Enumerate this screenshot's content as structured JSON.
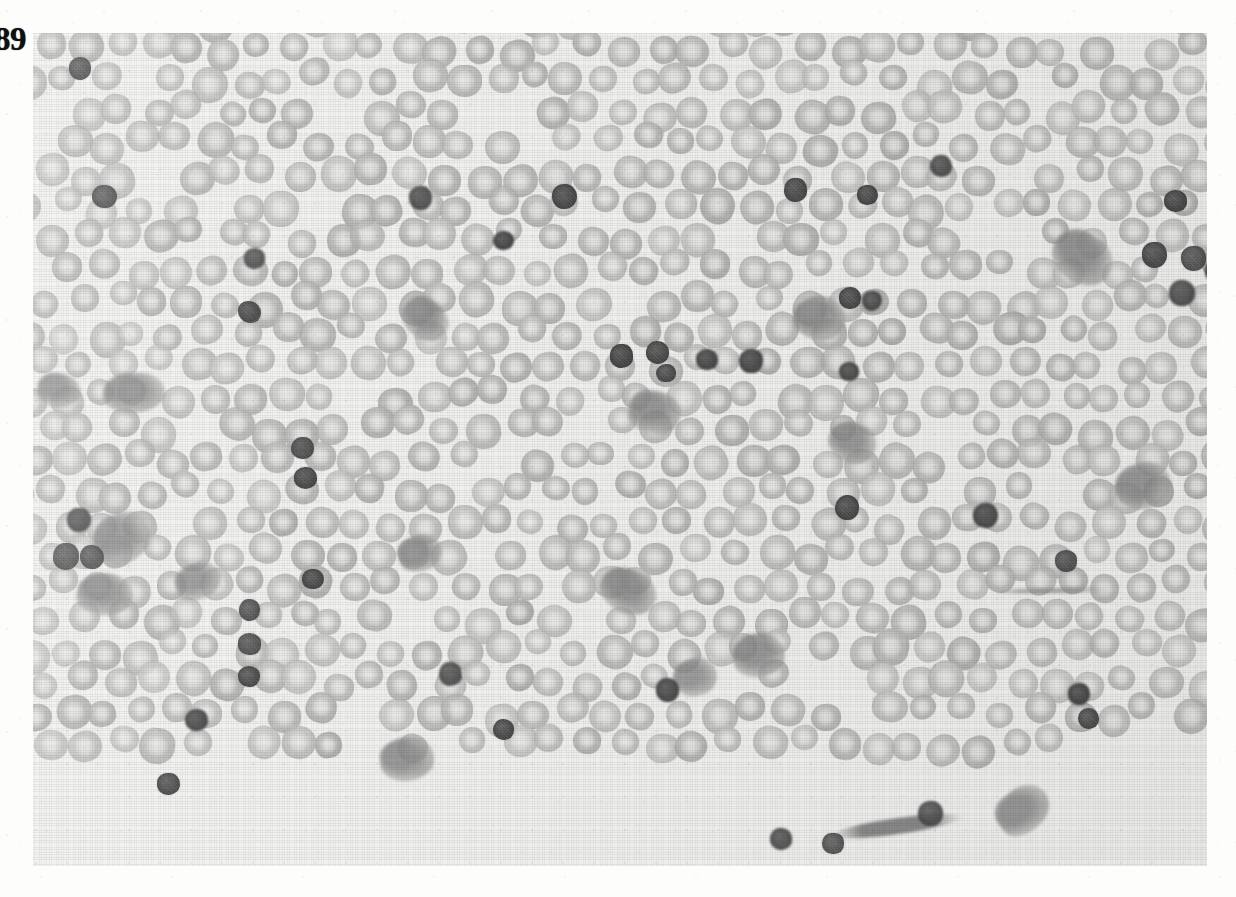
{
  "page": {
    "background_color": "#fdfdfc",
    "width": 1236,
    "height": 897
  },
  "figure": {
    "number_label": "89",
    "caption": "",
    "alt_text": "Peripheral blood smear photomicrograph showing a dense field of erythrocytes with numerous small dark-staining lymphocyte nuclei and scattered platelet clumps",
    "frame": {
      "left": 33,
      "top": 33,
      "width": 1174,
      "height": 833,
      "background_color": "#f1f1ef"
    }
  },
  "micrograph": {
    "title": "blood-smear-photomicrograph",
    "palette": {
      "background": "#f1f1ef",
      "erythrocyte": "#c6c6c4",
      "erythrocyte_dark": "#b2b2b0",
      "erythrocyte_pale_center": "#e6e6e4",
      "lymphocyte_nucleus": "#5a5a5a",
      "lymphocyte_nucleus_dark": "#454545",
      "platelet_clump": "#9a9a9a",
      "figure_number": "#101010"
    },
    "counts": {
      "erythrocytes": 760,
      "lymphocyte_nuclei": 46,
      "platelet_clumps": 17
    },
    "cell_sizes": {
      "erythrocyte_diameter_px": [
        26,
        36
      ],
      "lymphocyte_diameter_px": [
        18,
        30
      ],
      "clump_diameter_px": [
        28,
        62
      ]
    },
    "lymphocytes": [
      {
        "x": 36,
        "y": 24,
        "d": 22,
        "tone": 0.92
      },
      {
        "x": 59,
        "y": 152,
        "d": 25,
        "tone": 0.78
      },
      {
        "x": 211,
        "y": 215,
        "d": 21,
        "tone": 0.8
      },
      {
        "x": 207,
        "y": 269,
        "d": 21,
        "tone": 0.88
      },
      {
        "x": 376,
        "y": 153,
        "d": 23,
        "tone": 0.82
      },
      {
        "x": 460,
        "y": 198,
        "d": 21,
        "tone": 0.86
      },
      {
        "x": 519,
        "y": 151,
        "d": 25,
        "tone": 0.88
      },
      {
        "x": 751,
        "y": 145,
        "d": 23,
        "tone": 0.85
      },
      {
        "x": 824,
        "y": 152,
        "d": 21,
        "tone": 0.84
      },
      {
        "x": 897,
        "y": 122,
        "d": 22,
        "tone": 0.83
      },
      {
        "x": 1131,
        "y": 157,
        "d": 23,
        "tone": 0.88
      },
      {
        "x": 1109,
        "y": 209,
        "d": 25,
        "tone": 0.92
      },
      {
        "x": 1148,
        "y": 213,
        "d": 25,
        "tone": 0.9
      },
      {
        "x": 1172,
        "y": 227,
        "d": 22,
        "tone": 0.86
      },
      {
        "x": 1136,
        "y": 247,
        "d": 26,
        "tone": 0.94
      },
      {
        "x": 806,
        "y": 254,
        "d": 22,
        "tone": 0.86
      },
      {
        "x": 829,
        "y": 258,
        "d": 20,
        "tone": 0.82
      },
      {
        "x": 205,
        "y": 268,
        "d": 22,
        "tone": 0.88
      },
      {
        "x": 577,
        "y": 311,
        "d": 23,
        "tone": 0.88
      },
      {
        "x": 613,
        "y": 308,
        "d": 23,
        "tone": 0.9
      },
      {
        "x": 663,
        "y": 316,
        "d": 22,
        "tone": 0.86
      },
      {
        "x": 706,
        "y": 316,
        "d": 24,
        "tone": 0.88
      },
      {
        "x": 258,
        "y": 404,
        "d": 23,
        "tone": 0.88
      },
      {
        "x": 261,
        "y": 434,
        "d": 23,
        "tone": 0.9
      },
      {
        "x": 802,
        "y": 462,
        "d": 24,
        "tone": 0.86
      },
      {
        "x": 34,
        "y": 475,
        "d": 24,
        "tone": 0.9
      },
      {
        "x": 20,
        "y": 510,
        "d": 26,
        "tone": 0.92
      },
      {
        "x": 47,
        "y": 512,
        "d": 24,
        "tone": 0.9
      },
      {
        "x": 940,
        "y": 470,
        "d": 25,
        "tone": 0.84
      },
      {
        "x": 1022,
        "y": 517,
        "d": 22,
        "tone": 0.86
      },
      {
        "x": 269,
        "y": 536,
        "d": 22,
        "tone": 0.88
      },
      {
        "x": 206,
        "y": 566,
        "d": 21,
        "tone": 0.8
      },
      {
        "x": 205,
        "y": 600,
        "d": 23,
        "tone": 0.82
      },
      {
        "x": 205,
        "y": 633,
        "d": 22,
        "tone": 0.84
      },
      {
        "x": 406,
        "y": 629,
        "d": 23,
        "tone": 0.86
      },
      {
        "x": 623,
        "y": 645,
        "d": 23,
        "tone": 0.9
      },
      {
        "x": 1035,
        "y": 650,
        "d": 22,
        "tone": 0.88
      },
      {
        "x": 1045,
        "y": 675,
        "d": 21,
        "tone": 0.86
      },
      {
        "x": 152,
        "y": 676,
        "d": 23,
        "tone": 0.92
      },
      {
        "x": 124,
        "y": 740,
        "d": 23,
        "tone": 0.9
      },
      {
        "x": 885,
        "y": 768,
        "d": 25,
        "tone": 0.86
      },
      {
        "x": 737,
        "y": 795,
        "d": 22,
        "tone": 0.88
      },
      {
        "x": 789,
        "y": 800,
        "d": 22,
        "tone": 0.88
      },
      {
        "x": 806,
        "y": 329,
        "d": 20,
        "tone": 0.78
      },
      {
        "x": 460,
        "y": 686,
        "d": 21,
        "tone": 0.84
      },
      {
        "x": 623,
        "y": 331,
        "d": 20,
        "tone": 0.8
      }
    ],
    "platelet_clumps": [
      {
        "x": 70,
        "y": 340,
        "w": 62,
        "h": 40,
        "tone": 0.55
      },
      {
        "x": 4,
        "y": 340,
        "w": 44,
        "h": 34,
        "tone": 0.52
      },
      {
        "x": 60,
        "y": 480,
        "w": 58,
        "h": 50,
        "tone": 0.5
      },
      {
        "x": 44,
        "y": 540,
        "w": 56,
        "h": 42,
        "tone": 0.55
      },
      {
        "x": 142,
        "y": 530,
        "w": 46,
        "h": 36,
        "tone": 0.48
      },
      {
        "x": 347,
        "y": 704,
        "w": 54,
        "h": 44,
        "tone": 0.5
      },
      {
        "x": 368,
        "y": 266,
        "w": 48,
        "h": 40,
        "tone": 0.52
      },
      {
        "x": 365,
        "y": 502,
        "w": 44,
        "h": 36,
        "tone": 0.48
      },
      {
        "x": 596,
        "y": 358,
        "w": 52,
        "h": 42,
        "tone": 0.52
      },
      {
        "x": 566,
        "y": 536,
        "w": 58,
        "h": 44,
        "tone": 0.54
      },
      {
        "x": 700,
        "y": 600,
        "w": 52,
        "h": 44,
        "tone": 0.52
      },
      {
        "x": 640,
        "y": 625,
        "w": 44,
        "h": 38,
        "tone": 0.46
      },
      {
        "x": 760,
        "y": 263,
        "w": 52,
        "h": 44,
        "tone": 0.5
      },
      {
        "x": 795,
        "y": 390,
        "w": 48,
        "h": 40,
        "tone": 0.5
      },
      {
        "x": 1018,
        "y": 200,
        "w": 62,
        "h": 50,
        "tone": 0.54
      },
      {
        "x": 1082,
        "y": 430,
        "w": 56,
        "h": 46,
        "tone": 0.5
      },
      {
        "x": 962,
        "y": 755,
        "w": 56,
        "h": 44,
        "tone": 0.52
      }
    ],
    "smudge_streaks": [
      {
        "x": 800,
        "y": 785,
        "w": 130,
        "h": 16,
        "angle": -8,
        "tone": 0.45
      },
      {
        "x": 960,
        "y": 555,
        "w": 120,
        "h": 5,
        "angle": -1,
        "tone": 0.22
      }
    ]
  }
}
